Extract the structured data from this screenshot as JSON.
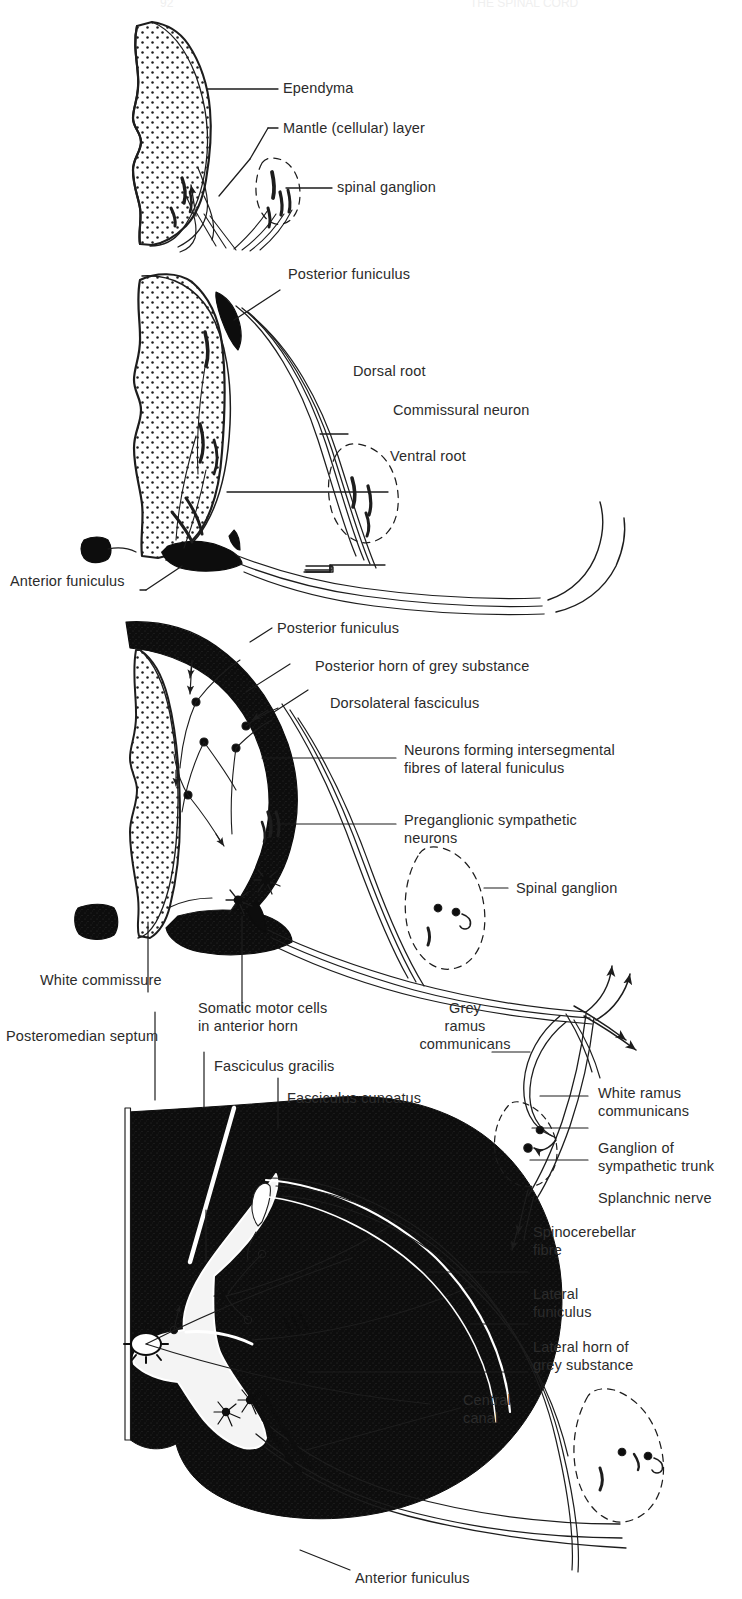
{
  "figure": {
    "background_color": "#ffffff",
    "ink_color": "#1d1d1d",
    "panel_count": 4
  },
  "header": {
    "page_number": "92",
    "running_head": "THE SPINAL CORD"
  },
  "panels": [
    {
      "id": "panel-1",
      "name": "embryonic-neural-tube",
      "labels": [
        {
          "key": "ependyma",
          "text": "Ependyma"
        },
        {
          "key": "mantle",
          "text": "Mantle (cellular) layer"
        },
        {
          "key": "spinal_ganglion",
          "text": "spinal ganglion"
        }
      ]
    },
    {
      "id": "panel-2",
      "name": "early-fetal-cord",
      "labels": [
        {
          "key": "posterior_funiculus",
          "text": "Posterior funiculus"
        },
        {
          "key": "dorsal_root",
          "text": "Dorsal root"
        },
        {
          "key": "commissural_neuron",
          "text": "Commissural neuron"
        },
        {
          "key": "ventral_root",
          "text": "Ventral root"
        },
        {
          "key": "anterior_funiculus",
          "text": "Anterior funiculus"
        }
      ]
    },
    {
      "id": "panel-3",
      "name": "later-fetal-cord",
      "labels": [
        {
          "key": "posterior_funiculus",
          "text": "Posterior funiculus"
        },
        {
          "key": "posterior_horn",
          "text": "Posterior horn of grey substance"
        },
        {
          "key": "dorsolateral_fasciculus",
          "text": "Dorsolateral fasciculus"
        },
        {
          "key": "intersegmental_line1",
          "text": "Neurons forming intersegmental"
        },
        {
          "key": "intersegmental_line2",
          "text": "fibres of lateral funiculus"
        },
        {
          "key": "preganglionic_line1",
          "text": "Preganglionic sympathetic"
        },
        {
          "key": "preganglionic_line2",
          "text": "neurons"
        },
        {
          "key": "spinal_ganglion",
          "text": "Spinal ganglion"
        },
        {
          "key": "white_commissure",
          "text": "White commissure"
        },
        {
          "key": "somatic_line1",
          "text": "Somatic motor cells"
        },
        {
          "key": "somatic_line2",
          "text": "in anterior horn"
        },
        {
          "key": "grey_ramus_line1",
          "text": "Grey"
        },
        {
          "key": "grey_ramus_line2",
          "text": "ramus"
        },
        {
          "key": "grey_ramus_line3",
          "text": "communicans"
        }
      ]
    },
    {
      "id": "panel-4",
      "name": "adult-spinal-cord",
      "labels": [
        {
          "key": "posteromedian_septum",
          "text": "Posteromedian septum"
        },
        {
          "key": "fasciculus_gracilis",
          "text": "Fasciculus gracilis"
        },
        {
          "key": "fasciculus_cuneatus",
          "text": "Fasciculus cuneatus"
        },
        {
          "key": "spinocerebellar_line1",
          "text": "Spinocerebellar"
        },
        {
          "key": "spinocerebellar_line2",
          "text": "fibre"
        },
        {
          "key": "lateral_funiculus_line1",
          "text": "Lateral"
        },
        {
          "key": "lateral_funiculus_line2",
          "text": "funiculus"
        },
        {
          "key": "lateral_horn_line1",
          "text": "Lateral horn of"
        },
        {
          "key": "lateral_horn_line2",
          "text": "grey substance"
        },
        {
          "key": "central_canal_line1",
          "text": "Central"
        },
        {
          "key": "central_canal_line2",
          "text": "canal"
        },
        {
          "key": "anterior_funiculus",
          "text": "Anterior funiculus"
        },
        {
          "key": "white_ramus_line1",
          "text": "White ramus"
        },
        {
          "key": "white_ramus_line2",
          "text": "communicans"
        },
        {
          "key": "ganglion_trunk_line1",
          "text": "Ganglion of"
        },
        {
          "key": "ganglion_trunk_line2",
          "text": "sympathetic trunk"
        },
        {
          "key": "splanchnic_nerve",
          "text": "Splanchnic nerve"
        }
      ]
    }
  ]
}
